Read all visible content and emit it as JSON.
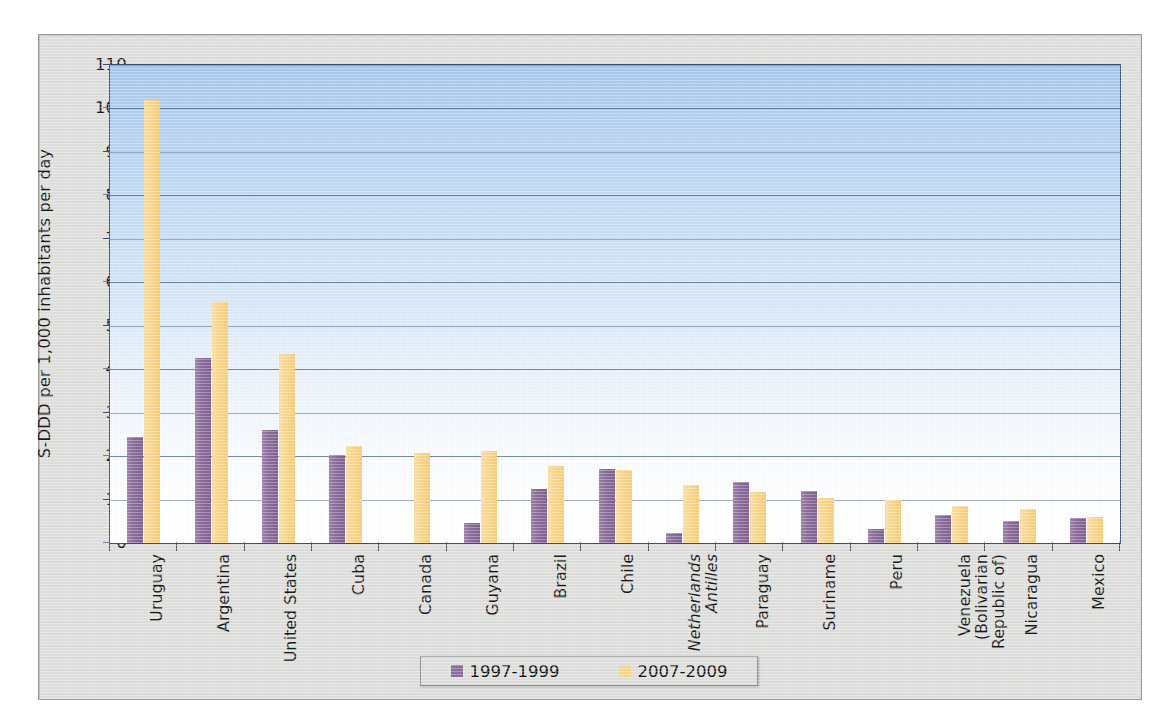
{
  "chart_data": {
    "type": "bar",
    "title": "",
    "xlabel": "",
    "ylabel": "S-DDD per 1,000 inhabitants per day",
    "ylim": [
      0,
      110
    ],
    "ytick_step": 10,
    "yticks": [
      0,
      10,
      20,
      30,
      40,
      50,
      60,
      70,
      80,
      90,
      100,
      110
    ],
    "grid": true,
    "legend_position": "bottom",
    "categories": [
      "Uruguay",
      "Argentina",
      "United States",
      "Cuba",
      "Canada",
      "Guyana",
      "Brazil",
      "Chile",
      "Netherlands Antilles",
      "Paraguay",
      "Suriname",
      "Peru",
      "Venezuela (Bolivarian Republic of)",
      "Nicaragua",
      "Mexico"
    ],
    "category_labels": [
      {
        "lines": [
          "Uruguay"
        ],
        "italic": false
      },
      {
        "lines": [
          "Argentina"
        ],
        "italic": false
      },
      {
        "lines": [
          "United States"
        ],
        "italic": false
      },
      {
        "lines": [
          "Cuba"
        ],
        "italic": false
      },
      {
        "lines": [
          "Canada"
        ],
        "italic": false
      },
      {
        "lines": [
          "Guyana"
        ],
        "italic": false
      },
      {
        "lines": [
          "Brazil"
        ],
        "italic": false
      },
      {
        "lines": [
          "Chile"
        ],
        "italic": false
      },
      {
        "lines": [
          "Netherlands",
          "Antilles"
        ],
        "italic": true
      },
      {
        "lines": [
          "Paraguay"
        ],
        "italic": false
      },
      {
        "lines": [
          "Suriname"
        ],
        "italic": false
      },
      {
        "lines": [
          "Peru"
        ],
        "italic": false
      },
      {
        "lines": [
          "Venezuela",
          "(Bolivarian",
          "Republic of)"
        ],
        "italic": false
      },
      {
        "lines": [
          "Nicaragua"
        ],
        "italic": false
      },
      {
        "lines": [
          "Mexico"
        ],
        "italic": false
      }
    ],
    "series": [
      {
        "name": "1997-1999",
        "color": "#8b6c9b",
        "values": [
          24.5,
          42.5,
          26.0,
          20.3,
          null,
          4.7,
          12.5,
          17.0,
          2.2,
          14.0,
          12.0,
          3.2,
          6.5,
          5.0,
          5.8
        ]
      },
      {
        "name": "2007-2009",
        "color": "#f9d68a",
        "values": [
          102.0,
          55.5,
          43.5,
          22.3,
          20.6,
          21.2,
          17.8,
          16.8,
          13.4,
          11.8,
          10.4,
          9.8,
          8.5,
          7.8,
          6.0
        ]
      }
    ]
  },
  "legend": {
    "items": [
      {
        "label": "1997-1999",
        "swatch": "s0"
      },
      {
        "label": "2007-2009",
        "swatch": "s1"
      }
    ]
  }
}
